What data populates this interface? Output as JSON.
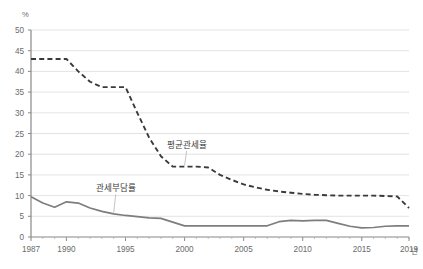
{
  "chart_data": {
    "type": "line",
    "title": "",
    "xlabel": "년",
    "ylabel": "%",
    "xlim": [
      1987,
      2019
    ],
    "ylim": [
      0,
      50
    ],
    "ytick_step": 5,
    "grid": true,
    "legend_position": "inline-annotation",
    "yticks": [
      "0",
      "5",
      "10",
      "15",
      "20",
      "25",
      "30",
      "35",
      "40",
      "45",
      "50"
    ],
    "xticks": [
      "1987",
      "1990",
      "1995",
      "2000",
      "2005",
      "2010",
      "2015",
      "2019"
    ],
    "x": [
      1987,
      1988,
      1989,
      1990,
      1991,
      1992,
      1993,
      1994,
      1995,
      1996,
      1997,
      1998,
      1999,
      2000,
      2001,
      2002,
      2003,
      2004,
      2005,
      2006,
      2007,
      2008,
      2009,
      2010,
      2011,
      2012,
      2013,
      2014,
      2015,
      2016,
      2017,
      2018,
      2019
    ],
    "series": [
      {
        "name": "평균관세율",
        "style": "dashed",
        "color": "#3a3a3a",
        "values": [
          43.0,
          43.0,
          43.0,
          43.0,
          40.0,
          37.5,
          36.2,
          36.2,
          36.2,
          30.0,
          24.0,
          19.5,
          17.0,
          17.0,
          17.0,
          16.8,
          15.0,
          13.8,
          12.7,
          12.0,
          11.4,
          11.0,
          10.7,
          10.4,
          10.2,
          10.1,
          10.0,
          10.0,
          10.0,
          10.0,
          9.9,
          9.8,
          7.0
        ]
      },
      {
        "name": "관세부담률",
        "style": "solid",
        "color": "#7d7d7d",
        "values": [
          9.7,
          8.2,
          7.2,
          8.5,
          8.2,
          7.0,
          6.2,
          5.6,
          5.2,
          4.9,
          4.6,
          4.5,
          3.6,
          2.7,
          2.7,
          2.7,
          2.7,
          2.7,
          2.7,
          2.7,
          2.7,
          3.7,
          4.0,
          3.9,
          4.0,
          4.0,
          3.3,
          2.6,
          2.2,
          2.3,
          2.6,
          2.7,
          2.7
        ]
      }
    ],
    "annotations": [
      {
        "label": "평균관세율",
        "x": 2000,
        "y": 21.5
      },
      {
        "label": "관세부담률",
        "x": 1994,
        "y": 11.0
      }
    ]
  }
}
